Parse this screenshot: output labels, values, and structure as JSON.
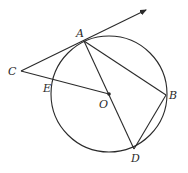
{
  "diagram": {
    "type": "geometry",
    "circle": {
      "center": "O",
      "cx": 109,
      "cy": 94,
      "r": 58
    },
    "points": {
      "A": {
        "x": 84,
        "y": 41,
        "label": "A"
      },
      "B": {
        "x": 166,
        "y": 95,
        "label": "B"
      },
      "C": {
        "x": 21,
        "y": 71,
        "label": "C"
      },
      "D": {
        "x": 134,
        "y": 149,
        "label": "D"
      },
      "E": {
        "x": 52,
        "y": 83,
        "label": "E"
      },
      "O": {
        "x": 109,
        "y": 94,
        "label": "O"
      }
    },
    "segments": [
      "CA (extended as ray)",
      "CE-O",
      "AB",
      "AD",
      "BD"
    ],
    "ray_end": {
      "x": 146,
      "y": 10
    },
    "colors": {
      "stroke": "#2a2a2a",
      "background": "#ffffff"
    }
  }
}
